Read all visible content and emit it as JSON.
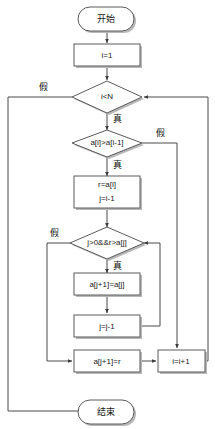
{
  "diagram": {
    "type": "flowchart",
    "title": "",
    "language": "zh-CN",
    "algorithm_nodes": {
      "start": "开始",
      "init": "i=1",
      "cond_outer": "i<N",
      "cond_compare": "a[i]>a[i-1]",
      "save_key_line1": "r=a[i]",
      "save_key_line2": "j=i-1",
      "cond_inner": "j>0&&r>a[j]",
      "shift": "a[j+1]=a[j]",
      "dec_j": "j=j-1",
      "place": "a[j+1]=r",
      "inc_i": "i=i+1",
      "end": "结束"
    },
    "branch_labels": {
      "outer_false": "假",
      "outer_true": "真",
      "compare_true": "真",
      "compare_false": "假",
      "inner_false": "假",
      "inner_true": "真"
    },
    "colors": {
      "background": "#ffffff",
      "node_fill": "#ffffff",
      "node_stroke": "#5a5a5a",
      "node_shadow": "#b8b8b8",
      "connector": "#4a4a4a",
      "text": "#1a1a1a"
    }
  }
}
